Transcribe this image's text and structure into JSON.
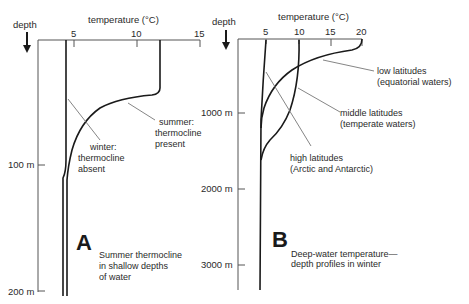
{
  "panel_a": {
    "letter": "A",
    "depth_label": "depth",
    "temp_label": "temperature (°C)",
    "x_ticks": [
      "5",
      "10",
      "15"
    ],
    "y_ticks": [
      "100 m",
      "200 m"
    ],
    "caption": [
      "Summer thermocline",
      "in shallow depths",
      "of water"
    ],
    "curves": [
      {
        "name": "winter",
        "label": [
          "winter:",
          "thermocline",
          "absent"
        ]
      },
      {
        "name": "summer",
        "label": [
          "summer:",
          "thermocline",
          "present"
        ]
      }
    ]
  },
  "panel_b": {
    "letter": "B",
    "depth_label": "depth",
    "temp_label": "temperature (°C)",
    "x_ticks": [
      "5",
      "10",
      "15",
      "20"
    ],
    "y_ticks": [
      "1000 m",
      "2000 m",
      "3000 m"
    ],
    "caption": [
      "Deep-water temperature—",
      "depth profiles in winter"
    ],
    "curves": [
      {
        "name": "low",
        "label": [
          "low latitudes",
          "(equatorial waters)"
        ]
      },
      {
        "name": "middle",
        "label": [
          "middle latitudes",
          "(temperate waters)"
        ]
      },
      {
        "name": "high",
        "label": [
          "high latitudes",
          "(Arctic and Antarctic)"
        ]
      }
    ]
  },
  "colors": {
    "ink": "#2a2a2a",
    "background": "#ffffff"
  }
}
